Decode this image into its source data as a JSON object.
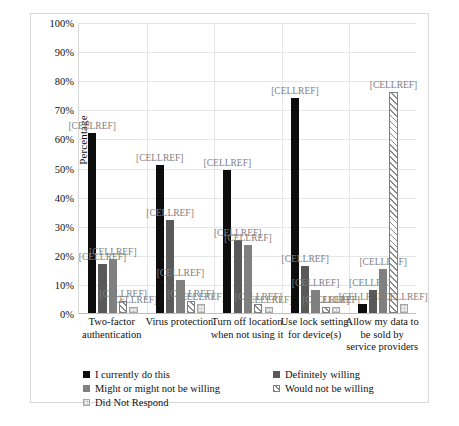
{
  "chart_data": {
    "type": "bar",
    "title": "",
    "xlabel": "",
    "ylabel": "Percentage",
    "ylim": [
      0,
      100
    ],
    "ytick_labels": [
      "100%",
      "90%",
      "80%",
      "70%",
      "60%",
      "50%",
      "40%",
      "30%",
      "20%",
      "10%",
      "0%"
    ],
    "ytick_values": [
      100,
      90,
      80,
      70,
      60,
      50,
      40,
      30,
      20,
      10,
      0
    ],
    "grid": true,
    "legend_position": "bottom",
    "data_label_text": "[CELLREF]",
    "categories": [
      "Two-factor authentication",
      "Virus protection",
      "Turn off location when not using it",
      "Use lock setting for device(s)",
      "Allow my data to be sold by service providers"
    ],
    "series": [
      {
        "name": "I currently do this",
        "color": "#0d0d0d",
        "values": [
          62,
          51,
          49,
          74,
          3
        ]
      },
      {
        "name": "Definitely willing",
        "color": "#595959",
        "values": [
          17,
          32,
          25,
          16,
          8
        ]
      },
      {
        "name": "Might or might not be willing",
        "color": "#808080",
        "values": [
          18.5,
          11.5,
          23.5,
          8,
          15
        ]
      },
      {
        "name": "Would not be willing",
        "color": "#ffffff",
        "values": [
          4,
          4,
          3,
          2,
          76
        ]
      },
      {
        "name": "Did Not Respond",
        "color": "#f2f2f2",
        "values": [
          2,
          3,
          2,
          2,
          3
        ]
      }
    ]
  },
  "legend": {
    "items": [
      {
        "label": "I currently do this"
      },
      {
        "label": "Definitely willing"
      },
      {
        "label": "Might or might not be willing"
      },
      {
        "label": "Would not be willing"
      },
      {
        "label": "Did Not Respond"
      }
    ]
  },
  "caption": {
    "text": ""
  }
}
